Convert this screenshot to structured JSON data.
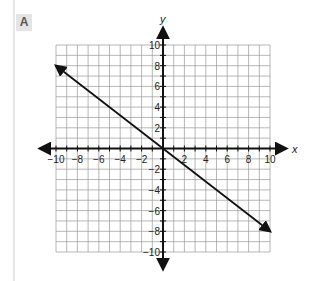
{
  "panel_label": "A",
  "chart_data": {
    "type": "line",
    "title": "",
    "xlabel": "x",
    "ylabel": "y",
    "xlim": [
      -10,
      10
    ],
    "ylim": [
      -10,
      10
    ],
    "grid": true,
    "grid_step": 1,
    "x_ticks": [
      "-10",
      "-8",
      "-6",
      "-4",
      "-2",
      "2",
      "4",
      "6",
      "8",
      "10"
    ],
    "y_ticks": [
      "10",
      "8",
      "6",
      "4",
      "2",
      "-2",
      "-4",
      "-6",
      "-8",
      "-10"
    ],
    "series": [
      {
        "name": "line",
        "x": [
          -10,
          0,
          10
        ],
        "y": [
          8,
          0,
          -8
        ],
        "equation": "y = -0.8x",
        "arrows_both_ends": true
      }
    ],
    "legend": "none"
  }
}
